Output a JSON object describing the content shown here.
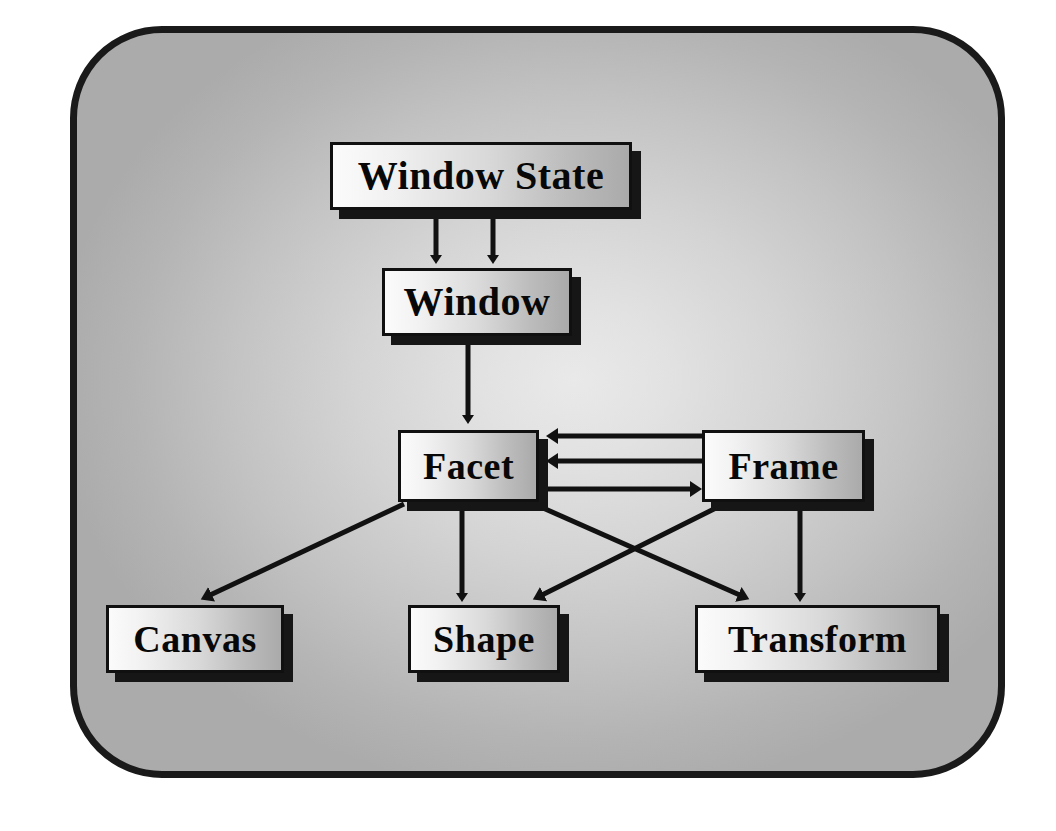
{
  "diagram": {
    "background_color": "#cfcfcf",
    "border_color": "#1a1a1a",
    "node_fill_light": "#fbfbfb",
    "node_fill_dark": "#aaaaaa",
    "edge_color": "#111111",
    "nodes": [
      {
        "id": "window-state",
        "label": "Window State"
      },
      {
        "id": "window",
        "label": "Window"
      },
      {
        "id": "facet",
        "label": "Facet"
      },
      {
        "id": "frame",
        "label": "Frame"
      },
      {
        "id": "canvas",
        "label": "Canvas"
      },
      {
        "id": "shape",
        "label": "Shape"
      },
      {
        "id": "transform",
        "label": "Transform"
      }
    ],
    "edges": [
      {
        "from": "window-state",
        "to": "window",
        "style": "arrow-down",
        "note": "left arrow"
      },
      {
        "from": "window-state",
        "to": "window",
        "style": "arrow-down",
        "note": "right arrow"
      },
      {
        "from": "window",
        "to": "facet",
        "style": "arrow-down"
      },
      {
        "from": "frame",
        "to": "facet",
        "style": "arrow-left",
        "note": "upper"
      },
      {
        "from": "frame",
        "to": "facet",
        "style": "arrow-left",
        "note": "middle"
      },
      {
        "from": "facet",
        "to": "frame",
        "style": "arrow-right",
        "note": "lower"
      },
      {
        "from": "facet",
        "to": "canvas",
        "style": "arrow-diagonal-left"
      },
      {
        "from": "facet",
        "to": "shape",
        "style": "arrow-down"
      },
      {
        "from": "facet",
        "to": "transform",
        "style": "arrow-diagonal-right-cross"
      },
      {
        "from": "frame",
        "to": "shape",
        "style": "arrow-diagonal-left-cross"
      },
      {
        "from": "frame",
        "to": "transform",
        "style": "arrow-down"
      }
    ]
  }
}
